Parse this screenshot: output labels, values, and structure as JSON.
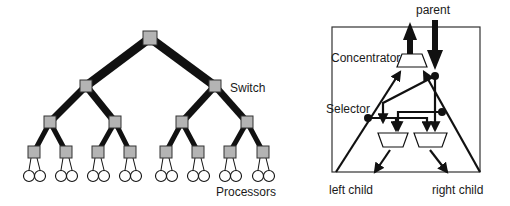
{
  "left_diagram": {
    "title": "fat-tree",
    "labels": {
      "switch": "Switch",
      "processors": "Processors"
    },
    "colors": {
      "switch_fill": "#b4b4b4",
      "edge": "#111111",
      "processor_fill": "#ffffff"
    },
    "levels": [
      {
        "y": 38,
        "xs": [
          150
        ],
        "edge_width": 9
      },
      {
        "y": 86,
        "xs": [
          86,
          215
        ],
        "edge_width": 7
      },
      {
        "y": 122,
        "xs": [
          50,
          115,
          182,
          247
        ],
        "edge_width": 5
      },
      {
        "y": 152,
        "xs": [
          34,
          66,
          98,
          130,
          166,
          198,
          230,
          263
        ],
        "edge_width": 3.5
      }
    ],
    "processor_count": 16
  },
  "right_diagram": {
    "labels": {
      "parent": "parent",
      "concentrator": "Concentrator",
      "selector": "Selector",
      "left_child": "left child",
      "right_child": "right child"
    }
  }
}
